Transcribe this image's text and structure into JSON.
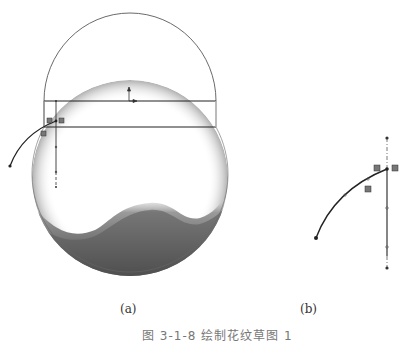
{
  "figure": {
    "panels": [
      {
        "id": "a",
        "label": "(a)",
        "description": "Sketch of a circle with a hemispherical dome and a horizontal band; a pattern curve drawn at left"
      },
      {
        "id": "b",
        "label": "(b)",
        "description": "Enlarged sketch of the curve with a vertical centerline"
      }
    ],
    "caption": "图 3-1-8  绘制花纹草图 1"
  },
  "colors": {
    "line": "#222222",
    "thin_line": "#555555",
    "shade_dark": "#4a4a4a",
    "background": "#ffffff"
  }
}
